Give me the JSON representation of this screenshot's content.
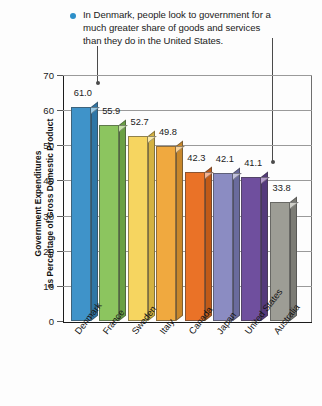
{
  "annotation": {
    "bullet_icon": "bullet-dot-icon",
    "bullet_color": "#2d8fc9",
    "text": "In Denmark, people look to government for a much greater share of goods and services than they do in the United States.",
    "line1": "In Denmark, people look to government for a",
    "line2": "much greater share of goods and services",
    "line3": "than they do in the United States.",
    "pointers": [
      "Denmark",
      "United States"
    ]
  },
  "chart_data": {
    "type": "bar",
    "title": "",
    "subtitle": "",
    "xlabel": "",
    "ylabel": "Government Expenditures as Percentage of Gross Domestic Product",
    "ylabel_line1": "Government Expenditures",
    "ylabel_line2": "as Percentage of Gross Domestic Product",
    "ylim": [
      0,
      70
    ],
    "ytick_step": 10,
    "ytick_labels": [
      "70",
      "60",
      "50",
      "40",
      "30",
      "20",
      "10",
      "0"
    ],
    "ytick_values": [
      70,
      60,
      50,
      40,
      30,
      20,
      10,
      0
    ],
    "grid": true,
    "legend": "none",
    "categories": [
      "Denmark",
      "France",
      "Sweden",
      "Italy",
      "Canada",
      "Japan",
      "United States",
      "Australia"
    ],
    "values": [
      61.0,
      55.9,
      52.7,
      49.8,
      42.3,
      42.1,
      41.1,
      33.8
    ],
    "value_labels": [
      "61.0",
      "55.9",
      "52.7",
      "49.8",
      "42.3",
      "42.1",
      "41.1",
      "33.8"
    ],
    "bar_colors": [
      "#3f93c9",
      "#8cc55f",
      "#f6d560",
      "#f0a93f",
      "#ea7227",
      "#8b8cc2",
      "#6f4f9e",
      "#9d9d95"
    ],
    "bar_top_colors": [
      "#9ccbe6",
      "#c6e3a8",
      "#fbeaa8",
      "#f8d39c",
      "#f5b392",
      "#c2c2dd",
      "#b49ccb",
      "#cfcfc8"
    ],
    "bar_side_colors": [
      "#2f76a6",
      "#6aa044",
      "#d4b241",
      "#c8872b",
      "#c05a18",
      "#6a6b9d",
      "#543a7c",
      "#7c7c75"
    ]
  }
}
